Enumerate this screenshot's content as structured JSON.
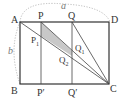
{
  "diagram": {
    "labels": {
      "A": "A",
      "B": "B",
      "C": "C",
      "D": "D",
      "P": "P",
      "Q": "Q",
      "P_prime": "P′",
      "Q_prime": "Q′",
      "P1": "P",
      "P1_sub": "1",
      "Q1": "Q",
      "Q1_sub": "1",
      "Q2": "Q",
      "Q2_sub": "2",
      "a": "a",
      "b": "b"
    },
    "colors": {
      "line": "#333333",
      "shade": "#c8c8c8",
      "arc": "#aaaaaa"
    }
  }
}
